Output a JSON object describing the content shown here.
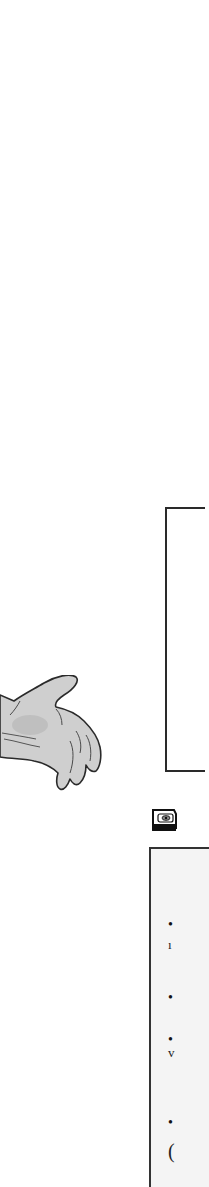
{
  "page": {
    "background": "#ffffff"
  },
  "top_box": {
    "border_color": "#2a2a2a"
  },
  "illustration": {
    "subject": "hand-drawn outstretched hand",
    "fill": "#cfcfcf",
    "stroke": "#2a2a2a"
  },
  "section_icon": {
    "icon": "disk-icon"
  },
  "bottom_box": {
    "background": "#f4f4f4",
    "border_color": "#333333",
    "items": [
      {
        "bullet": "•",
        "fragment": ""
      },
      {
        "bullet": "",
        "fragment": "ı"
      },
      {
        "bullet": "•",
        "fragment": ""
      },
      {
        "bullet": "•",
        "fragment": ""
      },
      {
        "bullet": "",
        "fragment": "v"
      },
      {
        "bullet": "•",
        "fragment": ""
      },
      {
        "bullet": "",
        "fragment": "("
      }
    ]
  }
}
